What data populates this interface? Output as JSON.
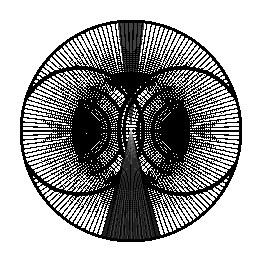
{
  "artwork": {
    "title": "Owl Face Moire String-Art Disc",
    "medium": "line art",
    "background_color": "#ffffff",
    "ink_color": "#000000",
    "canvas": {
      "width": 259,
      "height": 266
    },
    "disc": {
      "center_x": 131,
      "center_y": 131,
      "radius": 110,
      "rim_stroke": 3
    },
    "eyes": [
      {
        "name": "left-eye",
        "center_x": 80,
        "center_y": 131,
        "ring_count": 22,
        "max_radius": 62,
        "spoke_count": 96,
        "pupil_radius": 7
      },
      {
        "name": "right-eye",
        "center_x": 182,
        "center_y": 131,
        "ring_count": 22,
        "max_radius": 62,
        "spoke_count": 96,
        "pupil_radius": 7
      }
    ],
    "beak": {
      "name": "beak-wedge",
      "apex_x": 131,
      "apex_y": 128,
      "base_half_width": 30,
      "base_y": 240
    },
    "heavy_rings": [
      18,
      30,
      44,
      58
    ],
    "pattern": {
      "type": "concentric-rings-and-radial-spokes",
      "description": "Two overlapping polar grids of concentric circles and radial spokes clipped to a filled black disc, producing a moire owl face."
    }
  }
}
